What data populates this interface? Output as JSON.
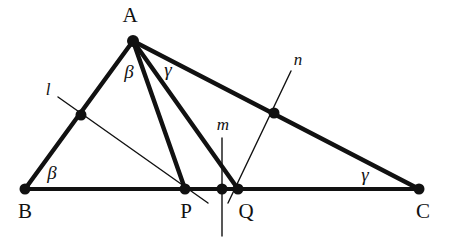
{
  "figure": {
    "type": "geometry-diagram",
    "width": 455,
    "height": 243,
    "background_color": "#ffffff",
    "stroke_color": "#111111",
    "thick_stroke_width": 4.0,
    "thin_stroke_width": 1.3,
    "point_radius": 5.5
  },
  "vertices": {
    "A": {
      "label": "A",
      "x": 133,
      "y": 41,
      "label_x": 130,
      "label_y": 15
    },
    "B": {
      "label": "B",
      "x": 25,
      "y": 189,
      "label_x": 25,
      "label_y": 211
    },
    "C": {
      "label": "C",
      "x": 419,
      "y": 189,
      "label_x": 423,
      "label_y": 211
    },
    "P": {
      "label": "P",
      "x": 185,
      "y": 189,
      "label_x": 186,
      "label_y": 211
    },
    "Q": {
      "label": "Q",
      "x": 238,
      "y": 189,
      "label_x": 246,
      "label_y": 211
    },
    "M_mid": {
      "label": "",
      "x": 222,
      "y": 189,
      "label_x": 0,
      "label_y": 0
    },
    "L_foot": {
      "label": "",
      "x": 81,
      "y": 115,
      "label_x": 0,
      "label_y": 0
    },
    "N_foot": {
      "label": "",
      "x": 274,
      "y": 113,
      "label_x": 0,
      "label_y": 0
    }
  },
  "line_labels": {
    "l": {
      "text": "l",
      "x": 48,
      "y": 89
    },
    "m": {
      "text": "m",
      "x": 223,
      "y": 124
    },
    "n": {
      "text": "n",
      "x": 298,
      "y": 59
    }
  },
  "angle_labels": [
    {
      "text": "β",
      "name": "beta-at-B",
      "x": 52,
      "y": 172
    },
    {
      "text": "β",
      "name": "beta-at-A",
      "x": 129,
      "y": 71
    },
    {
      "text": "γ",
      "name": "gamma-at-A",
      "x": 168,
      "y": 69
    },
    {
      "text": "γ",
      "name": "gamma-at-C",
      "x": 365,
      "y": 174
    }
  ],
  "segments": {
    "side_AB": {
      "name": "segment-AB",
      "x1": 25,
      "y1": 189,
      "x2": 133,
      "y2": 41
    },
    "side_AC": {
      "name": "segment-AC",
      "x1": 133,
      "y1": 41,
      "x2": 419,
      "y2": 189
    },
    "side_BC": {
      "name": "segment-BC",
      "x1": 25,
      "y1": 189,
      "x2": 419,
      "y2": 189
    },
    "cevian_AP": {
      "name": "segment-AP",
      "x1": 133,
      "y1": 41,
      "x2": 185,
      "y2": 189
    },
    "cevian_AQ": {
      "name": "segment-AQ",
      "x1": 133,
      "y1": 41,
      "x2": 238,
      "y2": 189
    },
    "line_l": {
      "name": "line-l",
      "x1": 58,
      "y1": 97,
      "x2": 208,
      "y2": 203
    },
    "line_m": {
      "name": "line-m",
      "x1": 222,
      "y1": 138,
      "x2": 222,
      "y2": 236
    },
    "line_n": {
      "name": "line-n",
      "x1": 291,
      "y1": 71,
      "x2": 228,
      "y2": 203
    }
  }
}
